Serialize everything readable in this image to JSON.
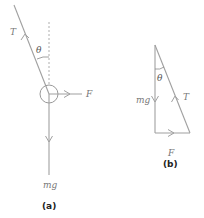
{
  "diagram_a": {
    "caption": "(a)",
    "labels": {
      "tension": "T",
      "angle": "θ",
      "force": "F",
      "weight": "mg"
    }
  },
  "diagram_b": {
    "caption": "(b)",
    "labels": {
      "tension": "T",
      "angle": "θ",
      "force": "F",
      "weight": "mg"
    }
  },
  "colors": {
    "line": "#a0a0a0",
    "text": "#777777",
    "caption": "#222222"
  }
}
